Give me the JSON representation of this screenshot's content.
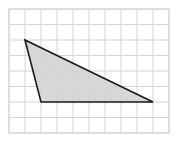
{
  "figure": {
    "grid": {
      "columns": 10,
      "rows": 8,
      "origin_px": [
        9,
        9
      ],
      "cell_px": [
        16,
        15.5
      ],
      "line_color": "#d4d4d4",
      "border_color": "#bdbdbd"
    },
    "triangle": {
      "vertices_grid": [
        [
          1,
          2
        ],
        [
          2,
          6
        ],
        [
          9,
          6
        ]
      ],
      "fill": "#d3d3d3",
      "stroke": "#1a1a1a"
    }
  }
}
